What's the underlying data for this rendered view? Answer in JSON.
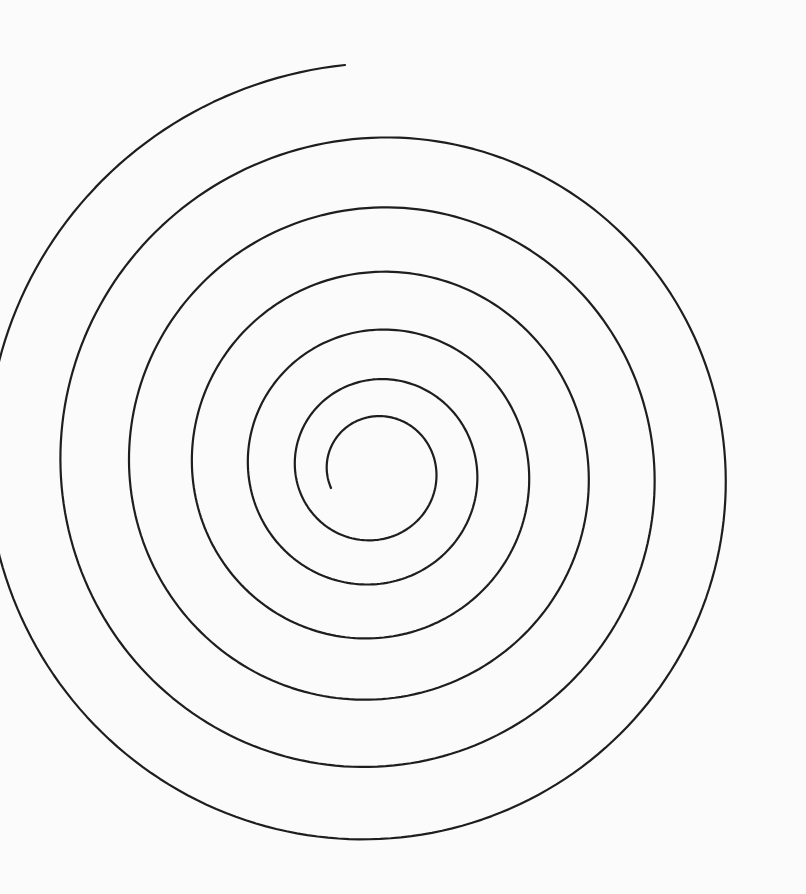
{
  "figure": {
    "type": "archimedean-spiral",
    "stroke_color": "#1e1e1e",
    "background_color": "#fbfbfb",
    "stroke_width": 2.2
  },
  "spiral": {
    "center_x": 375,
    "center_y": 470,
    "inner_end": [
      331,
      488
    ],
    "outer_end": [
      345,
      65
    ],
    "turns": 6
  }
}
